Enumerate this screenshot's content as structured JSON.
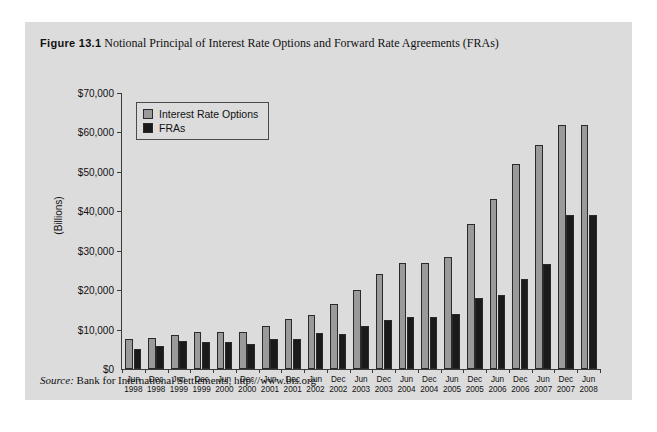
{
  "figure": {
    "label": "Figure 13.1",
    "title": "Notional Principal of Interest Rate Options and Forward Rate Agreements (FRAs)",
    "source_word": "Source:",
    "source_text": " Bank for International Settlements, http://www.bis.org"
  },
  "colors": {
    "panel_background": "#dcdcdc",
    "interest_rate_options": "#9a9a9a",
    "fras": "#1a1a1a",
    "axis": "#3a3a3a",
    "text": "#111111"
  },
  "chart_data": {
    "type": "bar",
    "title": "Notional Principal of Interest Rate Options and Forward Rate Agreements (FRAs)",
    "xlabel": "",
    "ylabel": "(Billions)",
    "ylim": [
      0,
      70000
    ],
    "ytick_labels": [
      "$70,000",
      "$60,000",
      "$50,000",
      "$40,000",
      "$30,000",
      "$20,000",
      "$10,000",
      "$0"
    ],
    "ytick_values": [
      70000,
      60000,
      50000,
      40000,
      30000,
      20000,
      10000,
      0
    ],
    "grid": false,
    "legend_position": "top-left-inside",
    "categories": [
      "Jun 1998",
      "Dec 1998",
      "Jun 1999",
      "Dec 1999",
      "Jun 2000",
      "Dec 2000",
      "Jun 2001",
      "Dec 2001",
      "Jun 2002",
      "Dec 2002",
      "Jun 2003",
      "Dec 2003",
      "Jun 2004",
      "Dec 2004",
      "Jun 2005",
      "Dec 2005",
      "Jun 2006",
      "Dec 2006",
      "Jun 2007",
      "Dec 2007",
      "Jun 2008"
    ],
    "category_lines": [
      [
        "Jun",
        "1998"
      ],
      [
        "Dec",
        "1998"
      ],
      [
        "Jun",
        "1999"
      ],
      [
        "Dec",
        "1999"
      ],
      [
        "Jun",
        "2000"
      ],
      [
        "Dec",
        "2000"
      ],
      [
        "Jun",
        "2001"
      ],
      [
        "Dec",
        "2001"
      ],
      [
        "Jun",
        "2002"
      ],
      [
        "Dec",
        "2002"
      ],
      [
        "Jun",
        "2003"
      ],
      [
        "Dec",
        "2003"
      ],
      [
        "Jun",
        "2004"
      ],
      [
        "Dec",
        "2004"
      ],
      [
        "Jun",
        "2005"
      ],
      [
        "Dec",
        "2005"
      ],
      [
        "Jun",
        "2006"
      ],
      [
        "Dec",
        "2006"
      ],
      [
        "Jun",
        "2007"
      ],
      [
        "Dec",
        "2007"
      ],
      [
        "Jun",
        "2008"
      ]
    ],
    "series": [
      {
        "name": "Interest Rate Options",
        "color": "#9a9a9a",
        "values": [
          7600,
          7900,
          8700,
          9400,
          9400,
          9500,
          10900,
          12600,
          13700,
          16500,
          20000,
          24000,
          27000,
          27000,
          28500,
          36700,
          43000,
          52000,
          56900,
          62000,
          62000
        ]
      },
      {
        "name": "FRAs",
        "color": "#1a1a1a",
        "values": [
          5100,
          5800,
          7100,
          6800,
          6800,
          6400,
          7700,
          7700,
          9100,
          8800,
          10800,
          12500,
          13300,
          13300,
          13900,
          18100,
          18700,
          22800,
          26600,
          39000,
          39000
        ]
      }
    ]
  },
  "legend": {
    "items": [
      {
        "label": "Interest Rate Options",
        "swatch": "opt"
      },
      {
        "label": "FRAs",
        "swatch": "fra"
      }
    ]
  }
}
